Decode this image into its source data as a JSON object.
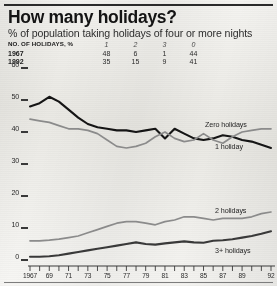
{
  "header": {
    "title": "How many holidays?",
    "subtitle": "% of population taking holidays of four or more nights"
  },
  "table": {
    "row_header_label": "NO. OF HOLIDAYS, %",
    "columns": [
      "1",
      "2",
      "3",
      "0"
    ],
    "rows": [
      {
        "year": "1967",
        "values": [
          "48",
          "6",
          "1",
          "44"
        ]
      },
      {
        "year": "1992",
        "values": [
          "35",
          "15",
          "9",
          "41"
        ]
      }
    ]
  },
  "chart_data": {
    "type": "line",
    "title": "How many holidays?",
    "subtitle": "% of population taking holidays of four or more nights",
    "xlabel": "",
    "ylabel": "",
    "ylim": [
      0,
      60
    ],
    "yticks": [
      0,
      10,
      20,
      30,
      40,
      50,
      60
    ],
    "grid": false,
    "legend": "inline-right",
    "x": [
      1967,
      1968,
      1969,
      1970,
      1971,
      1972,
      1973,
      1974,
      1975,
      1976,
      1977,
      1978,
      1979,
      1980,
      1981,
      1982,
      1983,
      1984,
      1985,
      1986,
      1987,
      1988,
      1989,
      1990,
      1991,
      1992
    ],
    "xtick_labels": [
      "1967",
      "69",
      "71",
      "73",
      "75",
      "77",
      "79",
      "81",
      "83",
      "85",
      "87",
      "89",
      "92"
    ],
    "xtick_values": [
      1967,
      1969,
      1971,
      1973,
      1975,
      1977,
      1979,
      1981,
      1983,
      1985,
      1987,
      1989,
      1992
    ],
    "series": [
      {
        "name": "1 holiday",
        "color": "#151515",
        "values": [
          48,
          49,
          51,
          49.5,
          47,
          44.5,
          42.5,
          41.5,
          41,
          40.5,
          40.5,
          40,
          40.5,
          41,
          38,
          41,
          39.5,
          38,
          37.5,
          38,
          39,
          38.5,
          37.5,
          37,
          36,
          35
        ]
      },
      {
        "name": "Zero holidays",
        "color": "#8c8c8c",
        "values": [
          44,
          43.5,
          43,
          42,
          41,
          41,
          40.5,
          39.5,
          37.5,
          35.5,
          35,
          35.5,
          36.5,
          38.5,
          40,
          38,
          37,
          37.5,
          39.5,
          37.5,
          36.5,
          38.5,
          40,
          40.5,
          41,
          41
        ]
      },
      {
        "name": "2 holidays",
        "color": "#8c8c8c",
        "values": [
          6,
          6,
          6.2,
          6.5,
          7,
          7.5,
          8.5,
          9.5,
          10.5,
          11.5,
          12,
          12,
          11.5,
          11,
          12,
          12.5,
          13.5,
          13.5,
          13,
          12.5,
          13,
          13,
          13,
          13.5,
          14.5,
          15
        ]
      },
      {
        "name": "3+ holidays",
        "color": "#3a3a3a",
        "values": [
          1,
          1,
          1.2,
          1.5,
          2,
          2.5,
          3,
          3.5,
          4,
          4.5,
          5,
          5.5,
          5,
          4.8,
          5.2,
          5.5,
          5.8,
          5.5,
          5.4,
          6,
          6.2,
          6.5,
          7,
          7.5,
          8.2,
          9
        ]
      }
    ]
  }
}
